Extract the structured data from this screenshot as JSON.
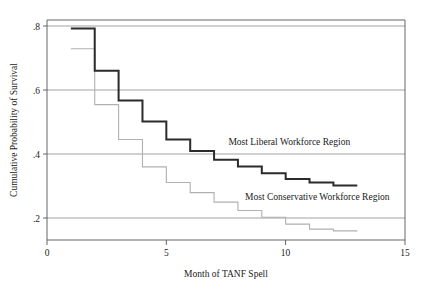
{
  "chart_data": {
    "type": "line",
    "subtype": "step-kaplan-meier",
    "title": "",
    "xlabel": "Month of TANF Spell",
    "ylabel": "Cumulative Probability of Survival",
    "xlim": [
      0,
      15
    ],
    "ylim": [
      0.18,
      0.83
    ],
    "xticks": [
      0,
      5,
      10,
      15
    ],
    "xtick_labels": [
      "0",
      "5",
      "10",
      "15"
    ],
    "yticks": [
      0.2,
      0.4,
      0.6,
      0.8
    ],
    "ytick_labels": [
      ".2",
      ".4",
      ".6",
      ".8"
    ],
    "grid": "horizontal",
    "legend_position": "inline-annotation",
    "series": [
      {
        "name": "Most Liberal Workforce Region",
        "label": "Most Liberal Workforce Region",
        "color": "#2b2b2b",
        "line_width": 2.0,
        "x": [
          1,
          2,
          3,
          4,
          5,
          6,
          7,
          8,
          9,
          10,
          11,
          12
        ],
        "values": [
          0.805,
          0.68,
          0.592,
          0.53,
          0.477,
          0.443,
          0.417,
          0.397,
          0.377,
          0.36,
          0.35,
          0.341
        ],
        "label_x": 7.6,
        "label_y": 0.462
      },
      {
        "name": "Most Conservative Workforce Region",
        "label": "Most Conservative Workforce Region",
        "color": "#b0b0b0",
        "line_width": 1.1,
        "x": [
          1,
          2,
          3,
          4,
          5,
          6,
          7,
          8,
          9,
          10,
          11,
          12
        ],
        "values": [
          0.745,
          0.58,
          0.477,
          0.396,
          0.35,
          0.32,
          0.292,
          0.267,
          0.247,
          0.227,
          0.212,
          0.207
        ],
        "label_x": 8.3,
        "label_y": 0.299
      }
    ]
  },
  "axes": {
    "y_title": "Cumulative Probability of Survival",
    "x_title": "Month of TANF Spell",
    "y_tick_0": ".2",
    "y_tick_1": ".4",
    "y_tick_2": ".6",
    "y_tick_3": ".8",
    "x_tick_0": "0",
    "x_tick_1": "5",
    "x_tick_2": "10",
    "x_tick_3": "15"
  },
  "annotations": {
    "liberal": "Most Liberal Workforce Region",
    "conservative": "Most Conservative Workforce Region"
  },
  "colors": {
    "background": "#ffffff",
    "axis": "#555555",
    "grid": "#8a8a8a",
    "liberal": "#2b2b2b",
    "conservative": "#b0b0b0",
    "text": "#1a1a1a"
  }
}
